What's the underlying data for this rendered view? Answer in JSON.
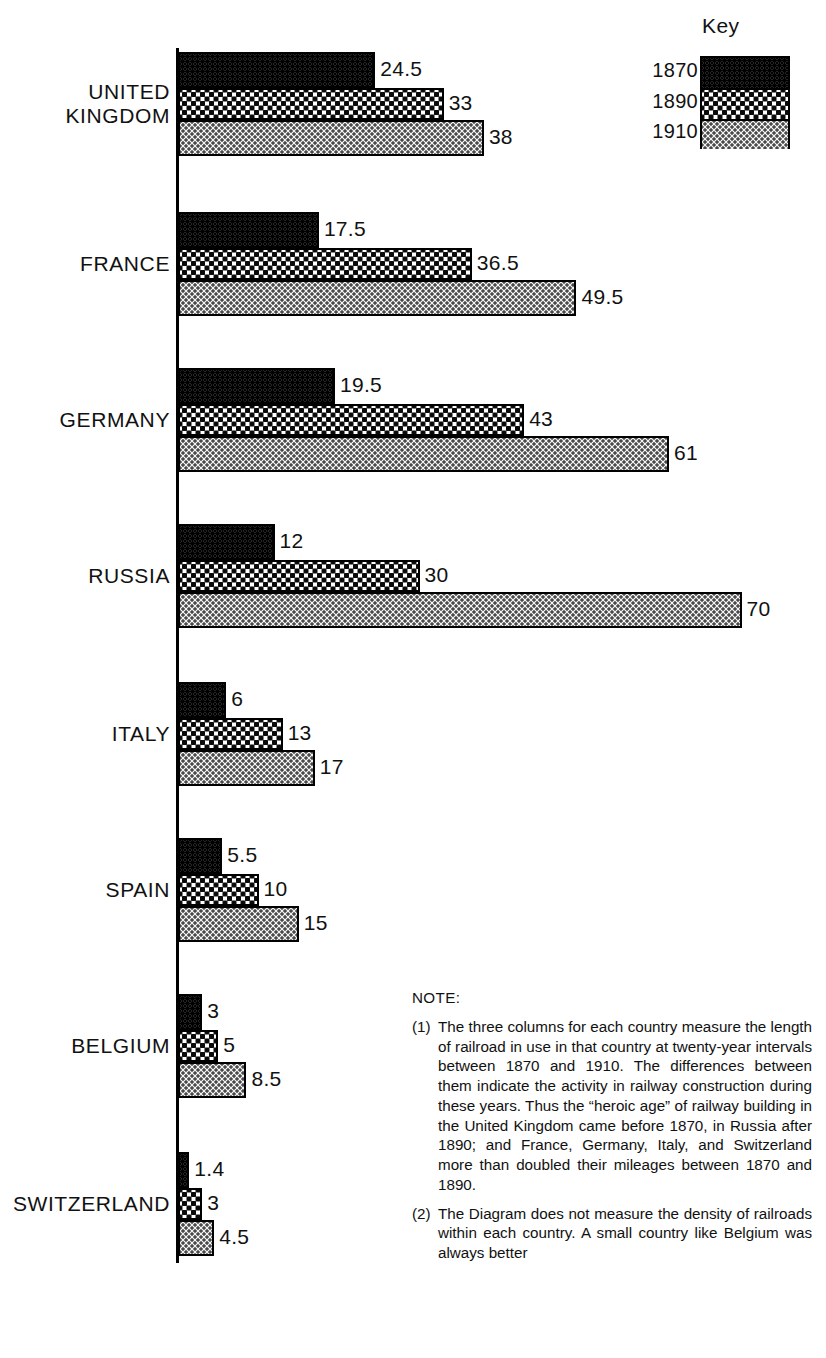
{
  "key": {
    "title": "Key",
    "entries": [
      {
        "label": "1870",
        "pattern": "dark-dense-dots"
      },
      {
        "label": "1890",
        "pattern": "medium-dots"
      },
      {
        "label": "1910",
        "pattern": "light-fine-dots"
      }
    ]
  },
  "note": {
    "heading": "NOTE:",
    "items": [
      {
        "num": "(1)",
        "text": "The three columns for each country measure the length of railroad in use in that country at twenty-year intervals between 1870 and 1910. The differences between them indicate the activity in railway construction during these years. Thus the “heroic age” of railway building in the United Kingdom came before 1870, in Russia after 1890; and France, Germany, Italy, and Switzerland more than doubled their mileages between 1870 and 1890."
      },
      {
        "num": "(2)",
        "text": "The Diagram does not measure the density of railroads within each country. A small country like Belgium was always better"
      }
    ]
  },
  "chart_data": {
    "type": "bar",
    "orientation": "horizontal",
    "title": "",
    "xlabel": "",
    "ylabel": "",
    "grid": false,
    "legend_position": "top-right",
    "categories": [
      "UNITED\nKINGDOM",
      "FRANCE",
      "GERMANY",
      "RUSSIA",
      "ITALY",
      "SPAIN",
      "BELGIUM",
      "SWITZERLAND"
    ],
    "series": [
      {
        "name": "1870",
        "values": [
          24.5,
          17.5,
          19.5,
          12,
          6,
          5.5,
          3,
          1.4
        ]
      },
      {
        "name": "1890",
        "values": [
          33,
          36.5,
          43,
          30,
          13,
          10,
          5,
          3
        ]
      },
      {
        "name": "1910",
        "values": [
          38,
          49.5,
          61,
          70,
          17,
          15,
          8.5,
          4.5
        ]
      }
    ],
    "value_labels": [
      [
        "24.5",
        "33",
        "38"
      ],
      [
        "17.5",
        "36.5",
        "49.5"
      ],
      [
        "19.5",
        "43",
        "61"
      ],
      [
        "12",
        "30",
        "70"
      ],
      [
        "6",
        "13",
        "17"
      ],
      [
        "5.5",
        "10",
        "15"
      ],
      [
        "3",
        "5",
        "8.5"
      ],
      [
        "1.4",
        "3",
        "4.5"
      ]
    ],
    "xlim": [
      0,
      70
    ]
  },
  "layout": {
    "group_tops": [
      52,
      212,
      368,
      524,
      682,
      838,
      994,
      1152
    ],
    "bar_heights": [
      36,
      32,
      36
    ],
    "axis_x": 178,
    "px_per_unit": 8.05
  }
}
